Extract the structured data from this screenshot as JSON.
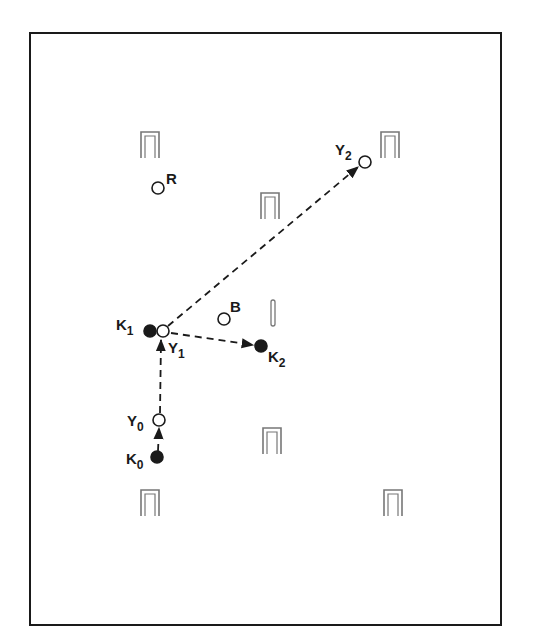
{
  "diagram": {
    "type": "croquet-court-shot-diagram",
    "frame": {
      "x": 30,
      "y": 33,
      "width": 471,
      "height": 592,
      "stroke": "#1a1a1a"
    },
    "colors": {
      "ink": "#1a1a1a",
      "wicket": "#777777",
      "background": "#ffffff"
    },
    "wickets": [
      {
        "id": "wicket-top-left",
        "x": 150,
        "y": 145
      },
      {
        "id": "wicket-top-right",
        "x": 390,
        "y": 145
      },
      {
        "id": "wicket-center-upper",
        "x": 270,
        "y": 206
      },
      {
        "id": "wicket-center-lower",
        "x": 272,
        "y": 441
      },
      {
        "id": "wicket-bottom-left",
        "x": 150,
        "y": 503
      },
      {
        "id": "wicket-bottom-right",
        "x": 393,
        "y": 503
      }
    ],
    "stake": {
      "x": 273,
      "y": 313
    },
    "balls": [
      {
        "id": "R",
        "label": "R",
        "sub": "",
        "x": 158,
        "y": 188,
        "filled": false
      },
      {
        "id": "B",
        "label": "B",
        "sub": "",
        "x": 224,
        "y": 319,
        "filled": false
      },
      {
        "id": "Y0",
        "label": "Y",
        "sub": "0",
        "x": 159,
        "y": 420,
        "filled": false
      },
      {
        "id": "Y1",
        "label": "Y",
        "sub": "1",
        "x": 163,
        "y": 331,
        "filled": false
      },
      {
        "id": "Y2",
        "label": "Y",
        "sub": "2",
        "x": 365,
        "y": 162,
        "filled": false
      },
      {
        "id": "K0",
        "label": "K",
        "sub": "0",
        "x": 157,
        "y": 457,
        "filled": true
      },
      {
        "id": "K1",
        "label": "K",
        "sub": "1",
        "x": 150,
        "y": 331,
        "filled": true
      },
      {
        "id": "K2",
        "label": "K",
        "sub": "2",
        "x": 261,
        "y": 346,
        "filled": true
      }
    ],
    "labels": {
      "R": {
        "text": "R",
        "x": 166,
        "y": 184
      },
      "B": {
        "text": "B",
        "x": 230,
        "y": 312
      },
      "Y0": {
        "text": "Y",
        "sub": "0",
        "x": 127,
        "y": 426
      },
      "Y1": {
        "text": "Y",
        "sub": "1",
        "x": 168,
        "y": 353
      },
      "Y2": {
        "text": "Y",
        "sub": "2",
        "x": 335,
        "y": 155
      },
      "K0": {
        "text": "K",
        "sub": "0",
        "x": 126,
        "y": 464
      },
      "K1": {
        "text": "K",
        "sub": "1",
        "x": 116,
        "y": 330
      },
      "K2": {
        "text": "K",
        "sub": "2",
        "x": 268,
        "y": 362
      }
    },
    "paths": [
      {
        "id": "K0-to-Y0",
        "from": [
          158,
          451
        ],
        "to": [
          159,
          428
        ]
      },
      {
        "id": "Y0-to-Y1",
        "from": [
          160,
          413
        ],
        "to": [
          161,
          340
        ]
      },
      {
        "id": "Y1-to-Y2",
        "from": [
          168,
          326
        ],
        "to": [
          358,
          167
        ]
      },
      {
        "id": "Y1-to-K2",
        "from": [
          171,
          333
        ],
        "to": [
          253,
          345
        ]
      }
    ]
  }
}
